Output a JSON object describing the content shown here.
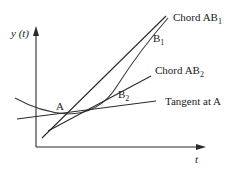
{
  "diagram": {
    "axes": {
      "y_label": "y (t)",
      "x_label": "t"
    },
    "points": {
      "A": "A",
      "B1": {
        "main": "B",
        "sub": "1"
      },
      "B2": {
        "main": "B",
        "sub": "2"
      }
    },
    "lines": {
      "chord_ab1": {
        "main": "Chord AB",
        "sub": "1"
      },
      "chord_ab2": {
        "main": "Chord AB",
        "sub": "2"
      },
      "tangent": "Tangent at A"
    },
    "colors": {
      "stroke": "#2a2a2a",
      "text": "#222222",
      "background": "#ffffff"
    }
  }
}
